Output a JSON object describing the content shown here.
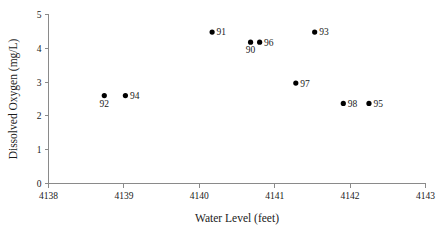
{
  "chart_data": {
    "type": "scatter",
    "title": "",
    "xlabel": "Water Level (feet)",
    "ylabel": "Dissolved Oxygen (mg/L)",
    "xlim": [
      4138,
      4143
    ],
    "ylim": [
      0,
      5
    ],
    "xticks": [
      "4138",
      "4139",
      "4140",
      "4141",
      "4142",
      "4143"
    ],
    "yticks": [
      "0",
      "1",
      "2",
      "3",
      "4",
      "5"
    ],
    "grid": false,
    "legend": "none",
    "marker_color": "#000000",
    "axis_color": "#8a8a8a",
    "points": [
      {
        "label": "92",
        "x": 4138.74,
        "y": 2.6,
        "label_pos": "below"
      },
      {
        "label": "94",
        "x": 4139.02,
        "y": 2.6,
        "label_pos": "right"
      },
      {
        "label": "91",
        "x": 4140.17,
        "y": 4.48,
        "label_pos": "right"
      },
      {
        "label": "90",
        "x": 4140.68,
        "y": 4.18,
        "label_pos": "below"
      },
      {
        "label": "96",
        "x": 4140.8,
        "y": 4.18,
        "label_pos": "right"
      },
      {
        "label": "93",
        "x": 4141.53,
        "y": 4.48,
        "label_pos": "right"
      },
      {
        "label": "97",
        "x": 4141.28,
        "y": 2.97,
        "label_pos": "right"
      },
      {
        "label": "98",
        "x": 4141.91,
        "y": 2.37,
        "label_pos": "right"
      },
      {
        "label": "95",
        "x": 4142.25,
        "y": 2.37,
        "label_pos": "right"
      }
    ]
  }
}
